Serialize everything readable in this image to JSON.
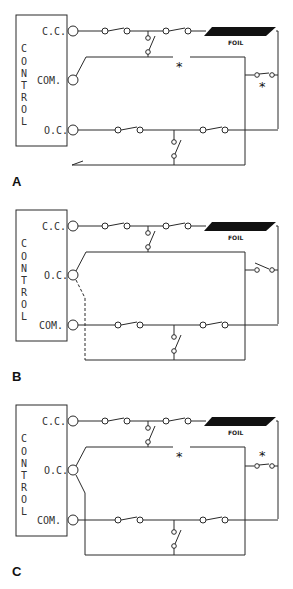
{
  "panels": [
    {
      "id": "A",
      "label": "A",
      "control_label": "CONTROL",
      "control_letters": [
        "C",
        "O",
        "N",
        "T",
        "R",
        "O",
        "L"
      ],
      "terminals": {
        "top": "C.C.",
        "middle": "COM.",
        "bottom": "O.C."
      },
      "foil_label": "FOIL",
      "fault_markers": [
        "*",
        "*"
      ]
    },
    {
      "id": "B",
      "label": "B",
      "control_label": "CONTROL",
      "control_letters": [
        "C",
        "O",
        "N",
        "T",
        "R",
        "O",
        "L"
      ],
      "terminals": {
        "top": "C.C.",
        "middle": "O.C.",
        "bottom": "COM."
      },
      "foil_label": "FOIL",
      "fault_markers": []
    },
    {
      "id": "C",
      "label": "C",
      "control_label": "CONTROL",
      "control_letters": [
        "C",
        "O",
        "N",
        "T",
        "R",
        "O",
        "L"
      ],
      "terminals": {
        "top": "C.C.",
        "middle": "O.C.",
        "bottom": "COM."
      },
      "foil_label": "FOIL",
      "fault_markers": [
        "*",
        "*"
      ]
    }
  ],
  "colors": {
    "line": "#2a2a2a",
    "foil": "#111111",
    "background": "#ffffff"
  }
}
